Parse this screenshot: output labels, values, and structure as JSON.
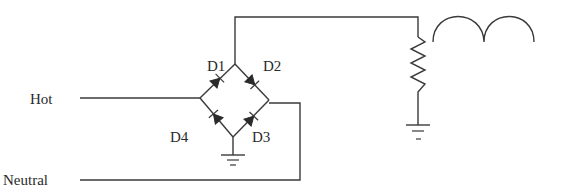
{
  "diagram": {
    "type": "circuit-schematic",
    "labels": {
      "hot": "Hot",
      "neutral": "Neutral",
      "d1": "D1",
      "d2": "D2",
      "d3": "D3",
      "d4": "D4"
    },
    "components": [
      {
        "id": "D1",
        "kind": "diode",
        "position": "upper-left of bridge"
      },
      {
        "id": "D2",
        "kind": "diode",
        "position": "upper-right of bridge"
      },
      {
        "id": "D3",
        "kind": "diode",
        "position": "lower-right of bridge"
      },
      {
        "id": "D4",
        "kind": "diode",
        "position": "lower-left of bridge"
      },
      {
        "id": "R",
        "kind": "resistor",
        "position": "load, right side"
      },
      {
        "id": "GND1",
        "kind": "ground",
        "position": "bridge bottom node"
      },
      {
        "id": "GND2",
        "kind": "ground",
        "position": "resistor bottom"
      },
      {
        "id": "WAVE",
        "kind": "rectified-waveform",
        "position": "top right, two humps"
      }
    ],
    "colors": {
      "ink": "#2a2a2a",
      "background": "#ffffff"
    }
  }
}
